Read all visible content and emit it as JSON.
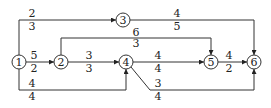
{
  "diagram": {
    "type": "activity-network",
    "nodes": [
      {
        "id": "1",
        "label": "1",
        "x": 19,
        "y": 62
      },
      {
        "id": "2",
        "label": "2",
        "x": 61,
        "y": 62
      },
      {
        "id": "3",
        "label": "3",
        "x": 123,
        "y": 20
      },
      {
        "id": "4",
        "label": "4",
        "x": 126,
        "y": 62
      },
      {
        "id": "5",
        "label": "5",
        "x": 211,
        "y": 62
      },
      {
        "id": "6",
        "label": "6",
        "x": 254,
        "y": 62
      }
    ],
    "edges": [
      {
        "from": "1",
        "to": "3",
        "top": "2",
        "bottom": "3"
      },
      {
        "from": "3",
        "to": "6",
        "top": "4",
        "bottom": "5"
      },
      {
        "from": "1",
        "to": "2",
        "top": "5",
        "bottom": "2"
      },
      {
        "from": "2",
        "to": "5",
        "top": "6",
        "bottom": "3"
      },
      {
        "from": "2",
        "to": "4",
        "top": "3",
        "bottom": "3"
      },
      {
        "from": "4",
        "to": "5",
        "top": "4",
        "bottom": "4"
      },
      {
        "from": "5",
        "to": "6",
        "top": "4",
        "bottom": "2"
      },
      {
        "from": "1",
        "to": "4",
        "top": "4",
        "bottom": "4"
      },
      {
        "from": "4",
        "to": "6",
        "top": "3",
        "bottom": "4"
      }
    ]
  }
}
